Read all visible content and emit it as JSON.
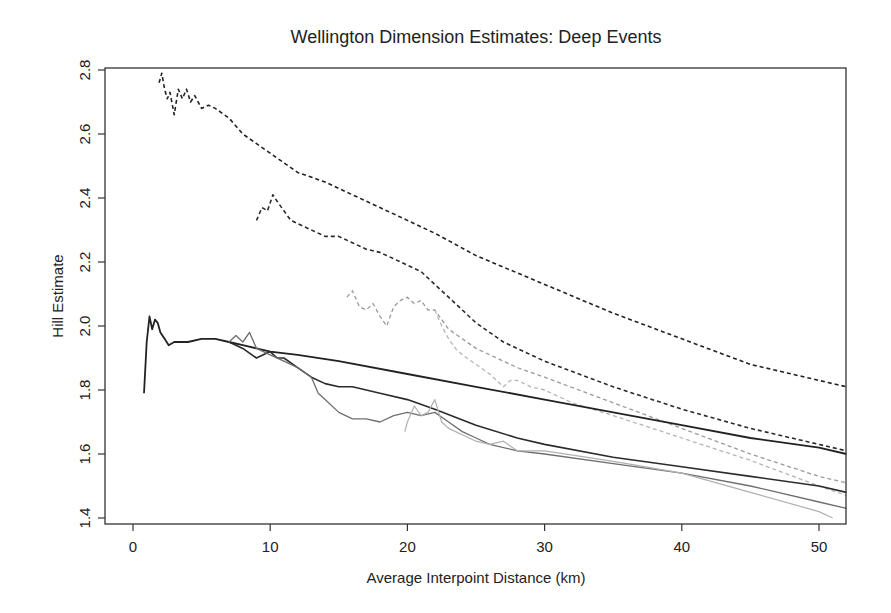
{
  "chart_data": {
    "type": "line",
    "title": "Wellington Dimension Estimates: Deep Events",
    "xlabel": "Average Interpoint Distance (km)",
    "ylabel": "Hill Estimate",
    "xlim": [
      -2,
      52
    ],
    "ylim": [
      1.4,
      2.8
    ],
    "xticks": [
      0,
      10,
      20,
      30,
      40,
      50
    ],
    "yticks": [
      1.4,
      1.6,
      1.8,
      2.0,
      2.2,
      2.4,
      2.6,
      2.8
    ],
    "xtick_labels": [
      "0",
      "10",
      "20",
      "30",
      "40",
      "50"
    ],
    "ytick_labels": [
      "1.4",
      "1.6",
      "1.8",
      "2.0",
      "2.2",
      "2.4",
      "2.6",
      "2.8"
    ],
    "grid": false,
    "legend": null,
    "series": [
      {
        "name": "dashed-dark-1",
        "style": "dashed",
        "color": "#222222",
        "width": 1.6,
        "x": [
          1.9,
          2.1,
          2.3,
          2.5,
          2.7,
          3.0,
          3.3,
          3.6,
          3.9,
          4.2,
          4.5,
          5.0,
          5.5,
          6.0,
          7.0,
          8.0,
          9.0,
          10.0,
          11.0,
          12.0,
          14.0,
          16.0,
          18.0,
          20.0,
          22.0,
          25.0,
          30.0,
          35.0,
          40.0,
          45.0,
          50.0,
          52.0
        ],
        "y": [
          2.76,
          2.79,
          2.74,
          2.71,
          2.73,
          2.66,
          2.74,
          2.71,
          2.74,
          2.7,
          2.72,
          2.68,
          2.69,
          2.68,
          2.65,
          2.6,
          2.57,
          2.54,
          2.51,
          2.48,
          2.45,
          2.41,
          2.37,
          2.33,
          2.29,
          2.22,
          2.13,
          2.04,
          1.96,
          1.88,
          1.83,
          1.81
        ]
      },
      {
        "name": "dashed-dark-2",
        "style": "dashed",
        "color": "#2a2a2a",
        "width": 1.6,
        "x": [
          9.0,
          9.4,
          9.8,
          10.2,
          10.5,
          11.0,
          11.5,
          12.0,
          13.0,
          14.0,
          15.0,
          16.0,
          17.0,
          18.0,
          19.0,
          20.0,
          21.0,
          22.0,
          23.0,
          24.0,
          25.0,
          27.0,
          30.0,
          35.0,
          40.0,
          45.0,
          50.0,
          52.0
        ],
        "y": [
          2.33,
          2.37,
          2.36,
          2.41,
          2.39,
          2.36,
          2.33,
          2.32,
          2.3,
          2.28,
          2.28,
          2.26,
          2.24,
          2.23,
          2.21,
          2.19,
          2.17,
          2.13,
          2.09,
          2.05,
          2.01,
          1.95,
          1.89,
          1.81,
          1.74,
          1.68,
          1.63,
          1.61
        ]
      },
      {
        "name": "dashed-light-1",
        "style": "dashed",
        "color": "#9a9a9a",
        "width": 1.3,
        "x": [
          15.6,
          16.0,
          16.5,
          17.0,
          17.5,
          18.0,
          18.5,
          19.0,
          19.5,
          20.0,
          20.5,
          21.0,
          21.5,
          22.0,
          22.5,
          23.0,
          24.0,
          25.0,
          26.0,
          28.0,
          30.0,
          35.0,
          40.0,
          45.0,
          50.0,
          52.0
        ],
        "y": [
          2.09,
          2.11,
          2.06,
          2.05,
          2.07,
          2.03,
          2.0,
          2.06,
          2.08,
          2.09,
          2.07,
          2.08,
          2.05,
          2.05,
          2.02,
          1.99,
          1.96,
          1.93,
          1.91,
          1.87,
          1.84,
          1.76,
          1.68,
          1.6,
          1.53,
          1.51
        ]
      },
      {
        "name": "dashed-light-2",
        "style": "dashed",
        "color": "#b5b5b5",
        "width": 1.3,
        "x": [
          22.0,
          22.5,
          23.0,
          23.5,
          24.0,
          25.0,
          26.0,
          27.0,
          27.5,
          28.0,
          29.0,
          30.0,
          32.0,
          35.0,
          40.0,
          45.0,
          50.0,
          52.0
        ],
        "y": [
          2.05,
          2.0,
          1.96,
          1.93,
          1.91,
          1.88,
          1.85,
          1.81,
          1.83,
          1.83,
          1.81,
          1.8,
          1.76,
          1.72,
          1.65,
          1.58,
          1.5,
          1.47
        ]
      },
      {
        "name": "solid-dark-1",
        "style": "solid",
        "color": "#222222",
        "width": 1.8,
        "x": [
          0.8,
          1.0,
          1.2,
          1.4,
          1.6,
          1.8,
          2.0,
          2.3,
          2.6,
          3.0,
          3.5,
          4.0,
          5.0,
          6.0,
          7.0,
          8.0,
          9.0,
          10.0,
          12.0,
          15.0,
          20.0,
          25.0,
          30.0,
          35.0,
          40.0,
          45.0,
          50.0,
          52.0
        ],
        "y": [
          1.79,
          1.95,
          2.03,
          1.99,
          2.02,
          2.01,
          1.98,
          1.96,
          1.94,
          1.95,
          1.95,
          1.95,
          1.96,
          1.96,
          1.95,
          1.94,
          1.93,
          1.92,
          1.91,
          1.89,
          1.85,
          1.81,
          1.77,
          1.73,
          1.69,
          1.65,
          1.62,
          1.6
        ]
      },
      {
        "name": "solid-dark-2",
        "style": "solid",
        "color": "#2b2b2b",
        "width": 1.6,
        "x": [
          7.0,
          8.0,
          9.0,
          9.5,
          10.0,
          10.5,
          11.0,
          12.0,
          13.0,
          14.0,
          15.0,
          16.0,
          18.0,
          20.0,
          22.0,
          25.0,
          28.0,
          30.0,
          35.0,
          40.0,
          45.0,
          50.0,
          52.0
        ],
        "y": [
          1.95,
          1.93,
          1.9,
          1.91,
          1.92,
          1.9,
          1.9,
          1.87,
          1.84,
          1.82,
          1.81,
          1.81,
          1.79,
          1.77,
          1.74,
          1.69,
          1.65,
          1.63,
          1.59,
          1.56,
          1.53,
          1.5,
          1.48
        ]
      },
      {
        "name": "solid-gray",
        "style": "solid",
        "color": "#6e6e6e",
        "width": 1.3,
        "x": [
          7.0,
          7.5,
          8.0,
          8.5,
          9.0,
          10.0,
          11.0,
          12.0,
          13.0,
          13.5,
          14.0,
          15.0,
          16.0,
          17.0,
          18.0,
          19.0,
          20.0,
          21.0,
          22.0,
          23.0,
          24.0,
          25.0,
          26.0,
          28.0,
          30.0,
          35.0,
          40.0,
          45.0,
          50.0,
          52.0
        ],
        "y": [
          1.95,
          1.97,
          1.95,
          1.98,
          1.93,
          1.91,
          1.89,
          1.87,
          1.84,
          1.79,
          1.77,
          1.73,
          1.71,
          1.71,
          1.7,
          1.72,
          1.73,
          1.72,
          1.73,
          1.7,
          1.67,
          1.65,
          1.63,
          1.61,
          1.6,
          1.57,
          1.54,
          1.5,
          1.45,
          1.43
        ]
      },
      {
        "name": "solid-light",
        "style": "solid",
        "color": "#b0b0b0",
        "width": 1.2,
        "x": [
          19.8,
          20.0,
          20.5,
          21.0,
          21.5,
          22.0,
          22.5,
          23.0,
          24.0,
          25.0,
          26.0,
          27.0,
          28.0,
          30.0,
          33.0,
          36.0,
          40.0,
          45.0,
          50.0,
          51.0
        ],
        "y": [
          1.67,
          1.7,
          1.75,
          1.72,
          1.73,
          1.77,
          1.7,
          1.68,
          1.66,
          1.64,
          1.63,
          1.64,
          1.61,
          1.61,
          1.59,
          1.57,
          1.54,
          1.48,
          1.42,
          1.4
        ]
      }
    ]
  }
}
